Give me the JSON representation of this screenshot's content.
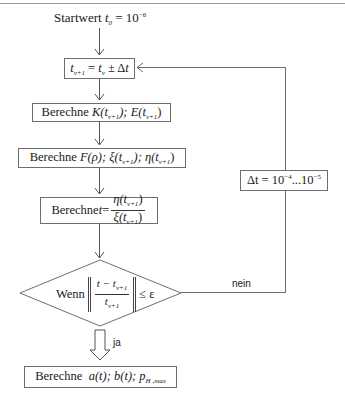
{
  "diagram": {
    "start": {
      "prefix": "Startwert",
      "var": "t",
      "sub": "0",
      "eq": " = 10",
      "exp": "−6"
    },
    "step_update": {
      "lhs": "t",
      "lhs_sub": "ν+1",
      "eq": " = ",
      "rhs": "t",
      "rhs_sub": "ν",
      "op": " ± Δ",
      "rhs2": "t"
    },
    "compute_KE": {
      "prefix": "Berechne ",
      "expr": "K(t",
      "sub1": "ν+1",
      "mid": "); E(t",
      "sub2": "ν+1",
      "end": ")"
    },
    "compute_F": {
      "prefix": "Berechne ",
      "expr": "F(ρ); ξ(t",
      "sub1": "ν+1",
      "mid": "); η(t",
      "sub2": "ν+1",
      "end": ")"
    },
    "compute_t": {
      "prefix": "Berechne ",
      "var": "t",
      "eq": " = ",
      "num": "η(t",
      "num_sub": "ν+1",
      "num_end": ")",
      "den": "ξ(t",
      "den_sub": "ν+1",
      "den_end": ")"
    },
    "decision": {
      "prefix": "Wenn",
      "num": "t − t",
      "num_sub": "ν+1",
      "den": "t",
      "den_sub": "ν+1",
      "cond": "≤ ε"
    },
    "no_label": "nein",
    "yes_label": "ja",
    "delta_box": {
      "prefix": "Δt = 10",
      "exp1": "−4",
      "mid": "...10",
      "exp2": "−5"
    },
    "result": {
      "prefix": "Berechne  ",
      "expr": "a(t); b(t); p",
      "sub": "H ,max"
    }
  },
  "colors": {
    "stroke": "#6e6e6e",
    "text": "#1a1a1a",
    "background": "#ffffff"
  }
}
